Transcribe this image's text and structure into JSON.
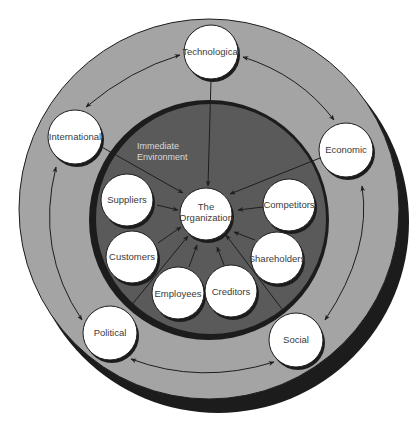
{
  "diagram": {
    "colors": {
      "background": "#ffffff",
      "outer_ring": "#a4a4a4",
      "outer_shadow": "#1c1c1c",
      "inner_environment": "#5a5a5a",
      "node_fill": "#ffffff",
      "node_border": "#1e1e1e",
      "arrow": "#1e1e1e"
    },
    "center": {
      "label_line1": "The",
      "label_line2": "Organization"
    },
    "immediate_environment": {
      "label_line1": "Immediate",
      "label_line2": "Environment",
      "nodes": [
        {
          "id": "suppliers",
          "label": "Suppliers"
        },
        {
          "id": "customers",
          "label": "Customers"
        },
        {
          "id": "employees",
          "label": "Employees"
        },
        {
          "id": "creditors",
          "label": "Creditors"
        },
        {
          "id": "shareholders",
          "label": "Shareholders"
        },
        {
          "id": "competitors",
          "label": "Competitors"
        }
      ]
    },
    "general_environment": {
      "nodes": [
        {
          "id": "technological",
          "label": "Technological"
        },
        {
          "id": "economic",
          "label": "Economic"
        },
        {
          "id": "social",
          "label": "Social"
        },
        {
          "id": "political",
          "label": "Political"
        },
        {
          "id": "international",
          "label": "International"
        }
      ]
    }
  }
}
